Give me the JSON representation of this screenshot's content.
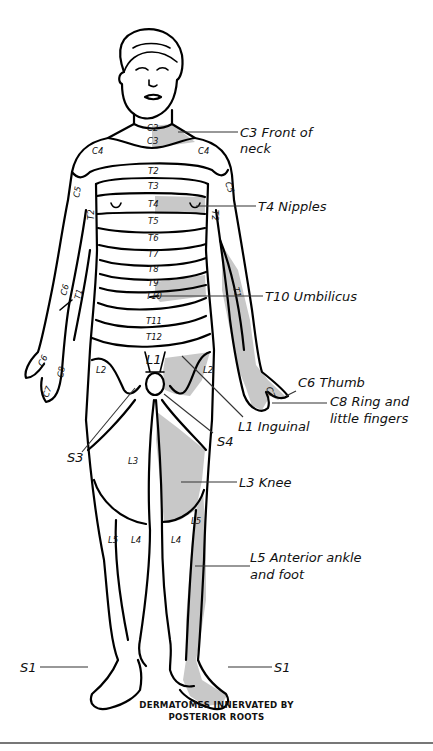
{
  "figure": {
    "title_line1": "DERMATOMES INNERVATED BY",
    "title_line2": "POSTERIOR ROOTS",
    "colors": {
      "outline": "#000000",
      "highlight_fill": "#c8c8c8",
      "background": "#ffffff",
      "rule": "#777777"
    }
  },
  "segment_labels": {
    "c2": "C2",
    "c3": "C3",
    "c4_left": "C4",
    "c4_right": "C4",
    "c5_left": "C5",
    "c5_right": "C5",
    "t2_top": "T2",
    "t2_left": "T2",
    "t2_right": "T2",
    "t3": "T3",
    "t4": "T4",
    "t5": "T5",
    "t6": "T6",
    "t7": "T7",
    "t8": "T8",
    "t9": "T9",
    "t10": "T10",
    "t11": "T11",
    "t12": "T12",
    "c6_left": "C6",
    "t1_left": "T1",
    "t1_right": "T1",
    "c6_hand": "C6",
    "c7_hand_left": "C7",
    "c8_hand_left": "C8",
    "c7_hand_right": "C7",
    "l1": "L1",
    "l2_left": "L2",
    "l2_right": "L2",
    "l3": "L3",
    "l4_left": "L4",
    "l4_right": "L4",
    "l5_left": "L5",
    "l5_right": "L5"
  },
  "callouts": [
    {
      "id": "c3",
      "line1": "C3 Front of",
      "line2": "neck"
    },
    {
      "id": "t4",
      "line1": "T4 Nipples"
    },
    {
      "id": "t10",
      "line1": "T10 Umbilicus"
    },
    {
      "id": "c6",
      "line1": "C6 Thumb"
    },
    {
      "id": "c8",
      "line1": "C8 Ring and",
      "line2": "little fingers"
    },
    {
      "id": "l1",
      "line1": "L1 Inguinal"
    },
    {
      "id": "s4",
      "line1": "S4"
    },
    {
      "id": "s3",
      "line1": "S3"
    },
    {
      "id": "l3",
      "line1": "L3 Knee"
    },
    {
      "id": "l5",
      "line1": "L5 Anterior ankle",
      "line2": "and foot"
    },
    {
      "id": "s1_left",
      "line1": "S1"
    },
    {
      "id": "s1_right",
      "line1": "S1"
    }
  ]
}
